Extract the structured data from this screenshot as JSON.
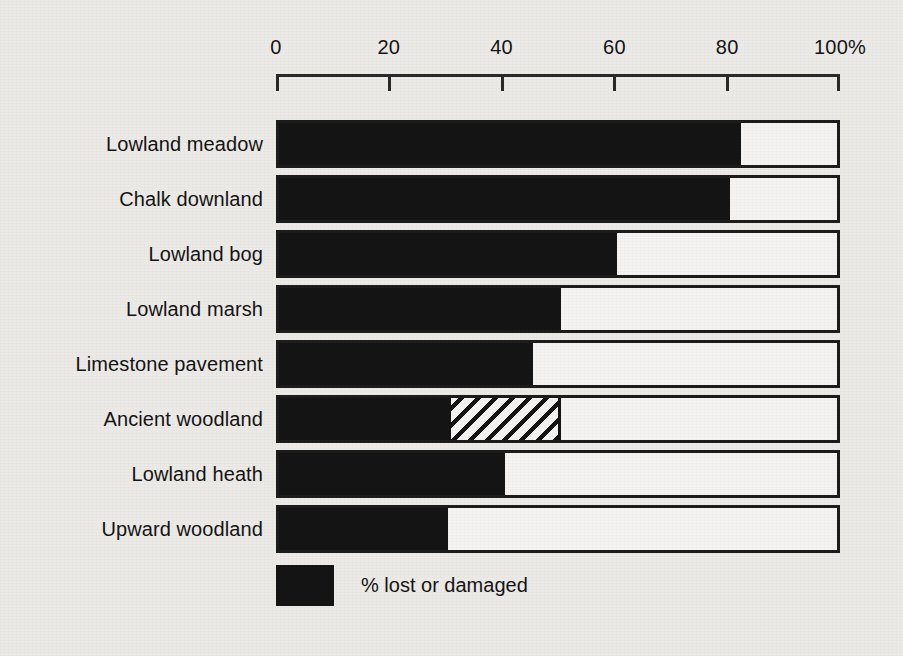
{
  "chart_data": {
    "type": "bar",
    "orientation": "horizontal",
    "title": "",
    "subtitle": "",
    "xlabel": "",
    "ylabel": "",
    "xlim": [
      0,
      100
    ],
    "grid": false,
    "axis_unit": "%",
    "tick_labels": [
      "0",
      "20",
      "40",
      "60",
      "80",
      "100%"
    ],
    "tick_values": [
      0,
      20,
      40,
      60,
      80,
      100
    ],
    "categories": [
      "Lowland meadow",
      "Chalk downland",
      "Lowland bog",
      "Lowland marsh",
      "Limestone pavement",
      "Ancient woodland",
      "Lowland heath",
      "Upward woodland"
    ],
    "series": [
      {
        "name": "% lost or damaged",
        "fill": "solid",
        "values": [
          82,
          80,
          60,
          50,
          45,
          30,
          40,
          30
        ]
      },
      {
        "name": "replanted / partially damaged",
        "fill": "hatched",
        "values": [
          0,
          0,
          0,
          0,
          0,
          20,
          0,
          0
        ]
      }
    ],
    "legend": {
      "position": "bottom-left",
      "entries": [
        {
          "label": "% lost or damaged",
          "fill": "solid",
          "color": "#141414"
        }
      ]
    },
    "colors": {
      "bar_fill": "#141414",
      "bar_outline": "#1c1c1c",
      "bar_empty": "#f4f3f1",
      "background": "#eceae7",
      "text": "#141414"
    }
  }
}
